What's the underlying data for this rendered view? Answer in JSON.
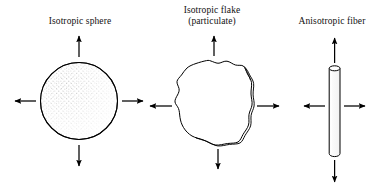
{
  "figure": {
    "kind": "schematic-diagram",
    "background_color": "#ffffff",
    "ink_color": "#000000",
    "stipple_color": "#9a9a9a",
    "panels": [
      {
        "id": "isotropic-sphere",
        "label_lines": [
          "Isotropic sphere"
        ],
        "shape": "sphere",
        "shape_description": "circle with stippled shading in upper-left interior",
        "arrows": [
          "up",
          "down",
          "left",
          "right"
        ],
        "arrow_lengths_equal": true
      },
      {
        "id": "isotropic-flake",
        "label_lines": [
          "Isotropic flake",
          "(particulate)"
        ],
        "shape": "flake",
        "shape_description": "irregular closed blob with a doubled edge line along the right and bottom giving plate thickness",
        "arrows": [
          "up",
          "down",
          "left",
          "right"
        ],
        "arrow_lengths_equal": true
      },
      {
        "id": "anisotropic-fiber",
        "label_lines": [
          "Anisotropic fiber"
        ],
        "shape": "fiber",
        "shape_description": "tall narrow vertical cylinder with elliptical cap at top",
        "arrows": [
          "up",
          "down",
          "left",
          "right"
        ],
        "arrow_lengths_equal": false,
        "arrow_note": "vertical arrows long, horizontal arrows short"
      }
    ]
  },
  "labels": {
    "sphere": {
      "line1": "Isotropic sphere"
    },
    "flake": {
      "line1": "Isotropic flake",
      "line2": "(particulate)"
    },
    "fiber": {
      "line1": "Anisotropic fiber"
    }
  }
}
